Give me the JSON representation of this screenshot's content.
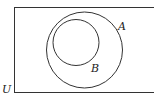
{
  "diagram": {
    "type": "venn",
    "universe": {
      "label": "U"
    },
    "sets": [
      {
        "id": "A",
        "label": "A"
      },
      {
        "id": "B",
        "label": "B",
        "subset_of": "A"
      }
    ],
    "colors": {
      "stroke": "#333333",
      "background": "#ffffff",
      "text": "#222222"
    }
  }
}
